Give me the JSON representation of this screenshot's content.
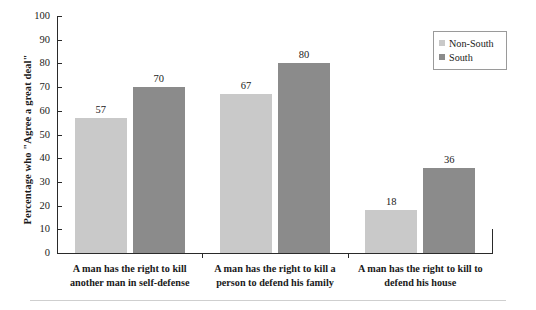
{
  "chart_data": {
    "type": "bar",
    "title": "",
    "subtitle": "",
    "xlabel": "",
    "ylabel": "Percentage who \"Agree a great deal\"",
    "ylim": [
      0,
      100
    ],
    "ytick_step": 10,
    "yticks": [
      "0",
      "10",
      "20",
      "30",
      "40",
      "50",
      "60",
      "70",
      "80",
      "90",
      "100"
    ],
    "grid": false,
    "legend_position": "top-right",
    "categories": [
      "A man has the right to kill another man in self-defense",
      "A man has the right to kill a person to defend his family",
      "A man has the right to kill to defend his house"
    ],
    "category_lines": [
      [
        "A man has the right to kill",
        "another man in self-defense"
      ],
      [
        "A man has the right to kill a",
        "person to defend his family"
      ],
      [
        "A man has the right to kill to",
        "defend his house"
      ]
    ],
    "series": [
      {
        "name": "Non-South",
        "color": "#c9c9c9",
        "values": [
          57,
          67,
          18
        ]
      },
      {
        "name": "South",
        "color": "#8b8b8b",
        "values": [
          70,
          80,
          36
        ]
      }
    ]
  },
  "legend": {
    "items": [
      {
        "label": "Non-South",
        "color": "#c9c9c9"
      },
      {
        "label": "South",
        "color": "#8b8b8b"
      }
    ]
  },
  "axis": {
    "y_title": "Percentage who \"Agree a great deal\"",
    "y_max_label": "100",
    "y_min_label": "0"
  }
}
